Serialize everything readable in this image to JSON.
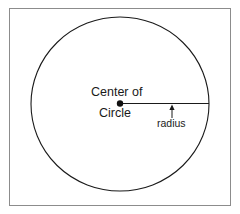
{
  "figure": {
    "type": "geometry-diagram",
    "background_color": "#ffffff",
    "stroke_color": "#1a1a1a",
    "border": {
      "name": "figure-border",
      "color": "#8c8c8c",
      "x": 9,
      "y": 8,
      "width": 222,
      "height": 198,
      "stroke_width": 1
    },
    "circle": {
      "name": "circle-outline",
      "center_x": 120,
      "center_y": 104,
      "radius_x": 89,
      "radius_y": 87,
      "stroke_width": 1.1,
      "fill": "none"
    },
    "center_point": {
      "name": "center-dot",
      "x": 120,
      "y": 103.5,
      "radius": 3.2,
      "fill": "#111111"
    },
    "radius_line": {
      "name": "radius-line",
      "x1": 120,
      "y1": 103.5,
      "x2": 209,
      "y2": 103.5,
      "stroke_width": 1.1
    },
    "arrow": {
      "name": "radius-arrow",
      "x": 172,
      "tip_y": 105,
      "tail_y": 118,
      "head_width": 5,
      "head_height": 5,
      "stroke_width": 1
    },
    "labels": {
      "center_line1": "Center of",
      "center_line2": "Circle",
      "radius": "radius"
    }
  }
}
